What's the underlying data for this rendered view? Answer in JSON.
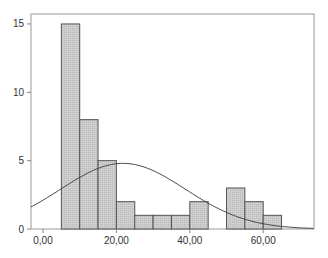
{
  "chart_data": {
    "type": "bar",
    "subtype": "histogram",
    "title": "",
    "xlabel": "",
    "ylabel": "",
    "bin_width": 5,
    "bins": [
      {
        "start": 5,
        "end": 10,
        "count": 15
      },
      {
        "start": 10,
        "end": 15,
        "count": 8
      },
      {
        "start": 15,
        "end": 20,
        "count": 5
      },
      {
        "start": 20,
        "end": 25,
        "count": 2
      },
      {
        "start": 25,
        "end": 30,
        "count": 1
      },
      {
        "start": 30,
        "end": 35,
        "count": 1
      },
      {
        "start": 35,
        "end": 40,
        "count": 1
      },
      {
        "start": 40,
        "end": 45,
        "count": 2
      },
      {
        "start": 45,
        "end": 50,
        "count": 0
      },
      {
        "start": 50,
        "end": 55,
        "count": 3
      },
      {
        "start": 55,
        "end": 60,
        "count": 2
      },
      {
        "start": 60,
        "end": 65,
        "count": 1
      }
    ],
    "categories": [
      "5-10",
      "10-15",
      "15-20",
      "20-25",
      "25-30",
      "30-35",
      "35-40",
      "40-45",
      "45-50",
      "50-55",
      "55-60",
      "60-65"
    ],
    "values": [
      15,
      8,
      5,
      2,
      1,
      1,
      1,
      2,
      0,
      3,
      2,
      1
    ],
    "normal_curve": {
      "mean": 21.8,
      "std": 17.0,
      "peak": 4.8
    },
    "xlim": [
      -3.3,
      74
    ],
    "ylim": [
      0,
      15.4
    ],
    "xticks": [
      0,
      20,
      40,
      60
    ],
    "xtick_labels": [
      "0,00",
      "20,00",
      "40,00",
      "60,00"
    ],
    "yticks": [
      0,
      5,
      10,
      15
    ],
    "ytick_labels": [
      "0",
      "5",
      "10",
      "15"
    ],
    "grid": false,
    "legend": null,
    "colors": {
      "bar_fill": "#c8c8c8",
      "bar_stroke": "#555555",
      "curve": "#333333",
      "axis": "#888888"
    }
  }
}
